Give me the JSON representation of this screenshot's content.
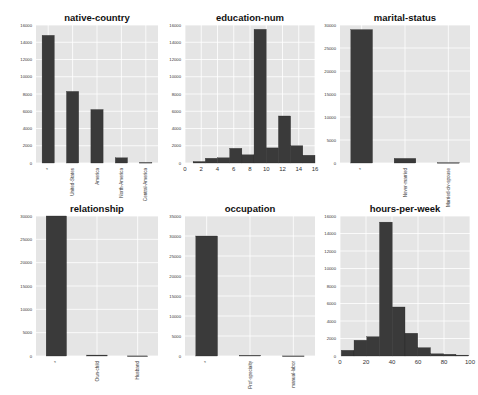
{
  "chart_data": [
    {
      "type": "bar",
      "title": "native-country",
      "categories": [
        "*",
        "United-States",
        "America",
        "North-America",
        "Central-America"
      ],
      "values": [
        14800,
        8300,
        6200,
        600,
        60
      ],
      "ylim": [
        0,
        16000
      ],
      "yticks": [
        0,
        2000,
        4000,
        6000,
        8000,
        10000,
        12000,
        14000,
        16000
      ],
      "grid": true
    },
    {
      "type": "histogram",
      "title": "education-num",
      "bin_edges": [
        1,
        2.5,
        4,
        5.5,
        7,
        8.5,
        10,
        11.5,
        13,
        14.5,
        16
      ],
      "values": [
        170,
        550,
        600,
        1700,
        950,
        15500,
        1750,
        5450,
        2000,
        900
      ],
      "xlim": [
        0,
        16
      ],
      "xticks": [
        0,
        2,
        4,
        6,
        8,
        10,
        12,
        14,
        16
      ],
      "ylim": [
        0,
        16000
      ],
      "yticks": [
        0,
        2000,
        4000,
        6000,
        8000,
        10000,
        12000,
        14000,
        16000
      ],
      "grid": true
    },
    {
      "type": "bar",
      "title": "marital-status",
      "categories": [
        "*",
        "Never-married",
        "Married-civ-spouse"
      ],
      "values": [
        29000,
        1000,
        80
      ],
      "ylim": [
        0,
        30000
      ],
      "yticks": [
        0,
        5000,
        10000,
        15000,
        20000,
        25000,
        30000
      ],
      "grid": true
    },
    {
      "type": "bar",
      "title": "relationship",
      "categories": [
        "*",
        "Own-child",
        "Husband"
      ],
      "values": [
        30000,
        200,
        20
      ],
      "ylim": [
        0,
        30000
      ],
      "yticks": [
        0,
        5000,
        10000,
        15000,
        20000,
        25000,
        30000
      ],
      "grid": true
    },
    {
      "type": "bar",
      "title": "occupation",
      "categories": [
        "*",
        "Prof-specialty",
        "manual-labor"
      ],
      "values": [
        30000,
        150,
        20
      ],
      "ylim": [
        0,
        35000
      ],
      "yticks": [
        0,
        5000,
        10000,
        15000,
        20000,
        25000,
        30000,
        35000
      ],
      "grid": true
    },
    {
      "type": "histogram",
      "title": "hours-per-week",
      "bin_edges": [
        1,
        10.8,
        20.6,
        30.4,
        40.2,
        50,
        59.8,
        69.6,
        79.4,
        89.2,
        99
      ],
      "values": [
        650,
        1800,
        2200,
        15300,
        5600,
        2600,
        950,
        250,
        200,
        100
      ],
      "xlim": [
        0,
        100
      ],
      "xticks": [
        0,
        20,
        40,
        60,
        80,
        100
      ],
      "ylim": [
        0,
        16000
      ],
      "yticks": [
        0,
        2000,
        4000,
        6000,
        8000,
        10000,
        12000,
        14000,
        16000
      ],
      "grid": true
    }
  ],
  "colors": {
    "bar": "#3a3a3a",
    "plot_bg": "#e5e5e5",
    "grid": "#ffffff"
  }
}
